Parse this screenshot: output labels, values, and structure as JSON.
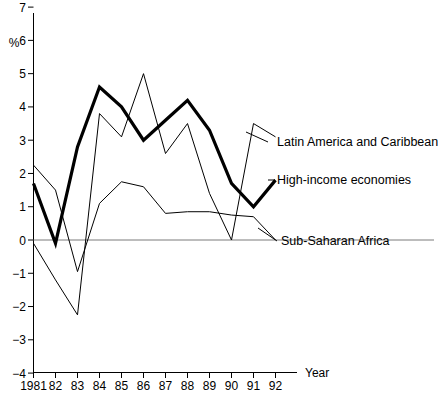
{
  "chart_data": {
    "type": "line",
    "title": "",
    "xlabel": "Year",
    "ylabel": "%",
    "x": [
      1981,
      1982,
      1983,
      1984,
      1985,
      1986,
      1987,
      1988,
      1989,
      1990,
      1991,
      1992
    ],
    "categories": [
      "1981",
      "82",
      "83",
      "84",
      "85",
      "86",
      "87",
      "88",
      "89",
      "90",
      "91",
      "92"
    ],
    "xlim": [
      1981,
      1992
    ],
    "ylim": [
      -4,
      7
    ],
    "yticks": [
      -4,
      -3,
      -2,
      -1,
      0,
      1,
      2,
      3,
      4,
      5,
      6,
      7
    ],
    "ytick_labels": [
      "−4",
      "−3",
      "−2",
      "−1",
      "0",
      "1",
      "2",
      "3",
      "4",
      "5",
      "6",
      "7"
    ],
    "grid": false,
    "legend_position": "right-inline-labels",
    "zero_line": true,
    "series": [
      {
        "name": "High-income economies",
        "style": "thick",
        "values": [
          1.7,
          -0.1,
          2.8,
          4.6,
          4.0,
          3.0,
          3.6,
          4.2,
          3.3,
          1.7,
          1.0,
          1.8
        ]
      },
      {
        "name": "Latin America and Caribbean",
        "style": "thin",
        "values": [
          -0.1,
          -1.2,
          -2.25,
          3.8,
          3.1,
          5.0,
          2.6,
          3.5,
          1.4,
          0.0,
          3.5,
          3.1
        ]
      },
      {
        "name": "Sub-Saharan Africa",
        "style": "thin",
        "values": [
          2.25,
          1.5,
          -0.95,
          1.1,
          1.75,
          1.6,
          0.8,
          0.85,
          0.85,
          0.75,
          0.7,
          0.0
        ]
      }
    ]
  },
  "legend": {
    "items": [
      {
        "label": "Latin America and Caribbean"
      },
      {
        "label": "High-income economies"
      },
      {
        "label": "Sub-Saharan Africa"
      }
    ]
  },
  "axes": {
    "y_unit": "%",
    "x_title": "Year"
  }
}
